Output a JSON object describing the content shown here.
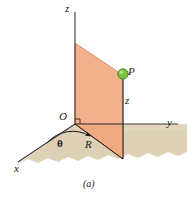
{
  "figure": {
    "caption": "(a)",
    "width_px": 187,
    "height_px": 199,
    "background_color": "#ffffff"
  },
  "axes": {
    "z_label": "z",
    "y_label": "y",
    "x_label": "x",
    "origin_label": "O",
    "axis_color": "#3a3a3a"
  },
  "point": {
    "label": "P",
    "marker_fill": "#7dc242",
    "marker_edge": "#4e7d22",
    "marker_highlight": "#bfe38c"
  },
  "coordinates": {
    "radial_label": "R",
    "angle_label": "θ",
    "height_label": "z"
  },
  "planes": {
    "ground_plane_name": "xy-plane",
    "ground_plane_fill": "#ded0b5",
    "ground_plane_edge": "#6b6355",
    "vertical_plane_name": "vertical half-plane",
    "vertical_plane_fill": "#f3b08d",
    "vertical_plane_edge": "#b4694a"
  },
  "markers": {
    "right_angle_name": "right-angle-mark",
    "arc_name": "theta-angle-arc"
  }
}
